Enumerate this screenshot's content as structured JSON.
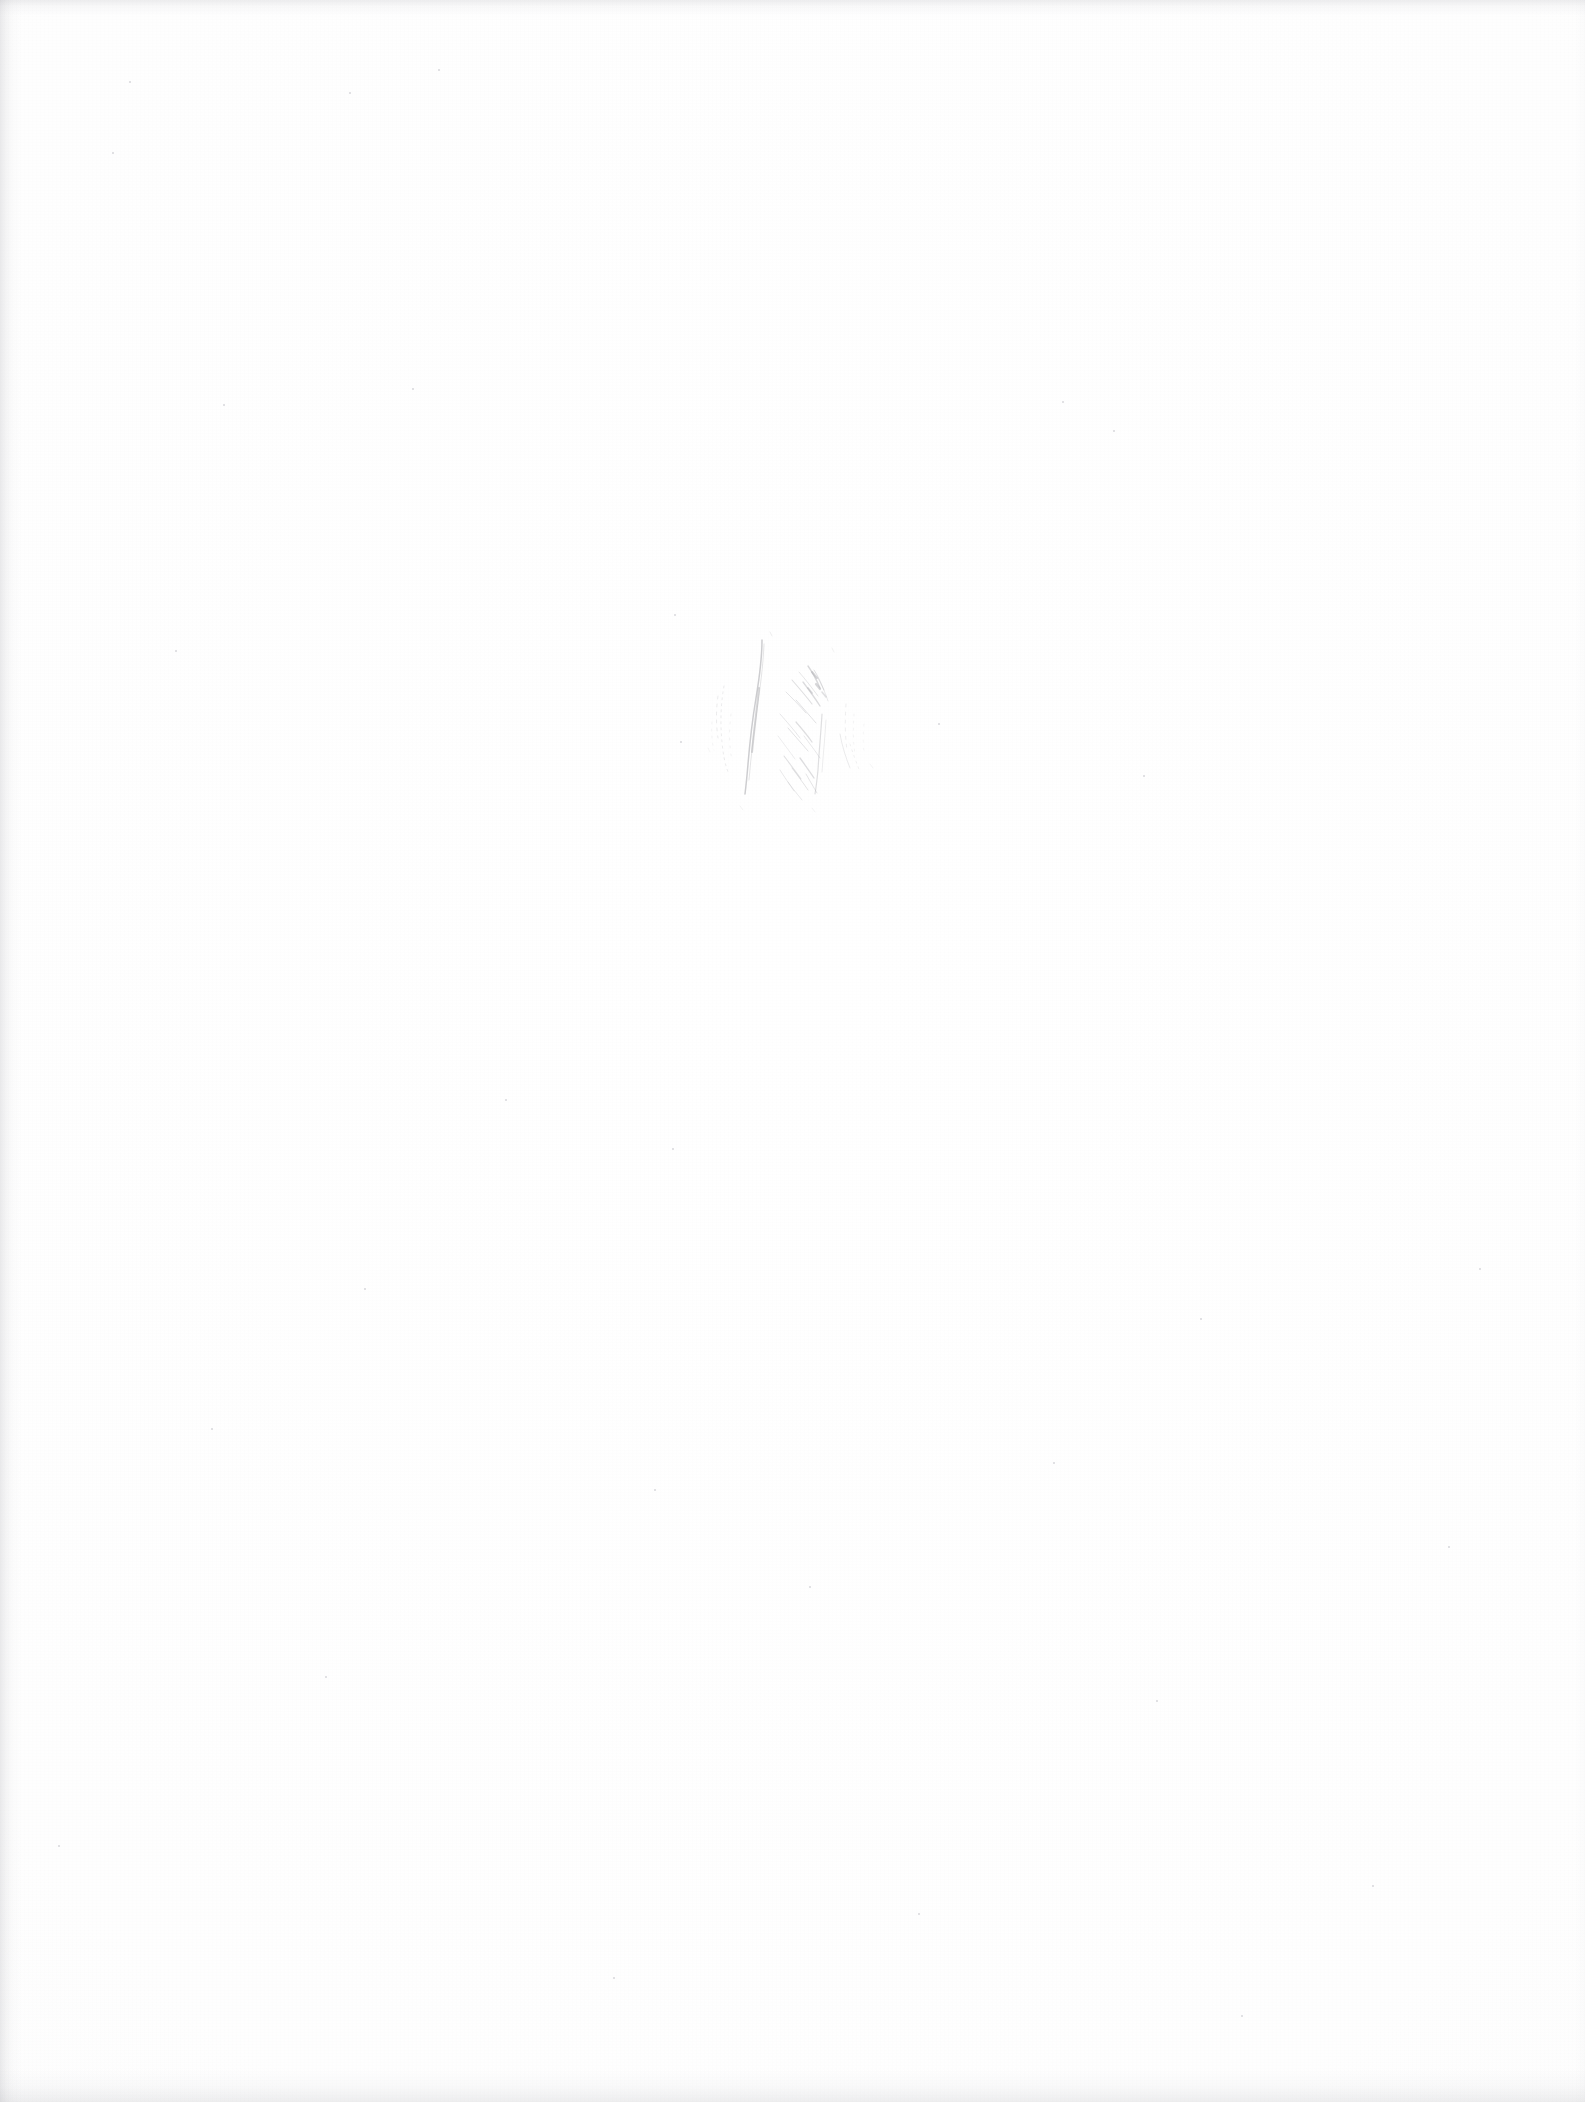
{
  "document": {
    "kind": "scanned-page",
    "page_title": "Blank scanned page",
    "background_color": "#fdfdfd",
    "width_px": 1585,
    "height_px": 2102,
    "text_content": "",
    "visible_text_lines": [],
    "notes_label": ""
  },
  "artifacts": {
    "pencil_mark": {
      "name": "pencil-smudge",
      "description": "Faint graphite pencil smudge of short near-vertical strokes",
      "ink_color": "#6e6e76",
      "bounds": {
        "x": 700,
        "y": 618,
        "width": 200,
        "height": 200
      },
      "opacity": 0.55
    },
    "edge_bands": [
      {
        "name": "left-edge-shadow",
        "side": "left",
        "thickness_px": 22,
        "color": "#96969e"
      },
      {
        "name": "top-edge-shadow",
        "side": "top",
        "thickness_px": 16,
        "color": "#96969e"
      },
      {
        "name": "bottom-edge-shadow",
        "side": "bottom",
        "thickness_px": 34,
        "color": "#96969e"
      },
      {
        "name": "right-edge-shadow",
        "side": "right",
        "thickness_px": 10,
        "color": "#bebec4"
      }
    ],
    "specks": [
      {
        "x": 129,
        "y": 81
      },
      {
        "x": 349,
        "y": 92
      },
      {
        "x": 438,
        "y": 69
      },
      {
        "x": 112,
        "y": 152
      },
      {
        "x": 1062,
        "y": 401
      },
      {
        "x": 223,
        "y": 404
      },
      {
        "x": 412,
        "y": 388
      },
      {
        "x": 1113,
        "y": 430
      },
      {
        "x": 674,
        "y": 614
      },
      {
        "x": 1143,
        "y": 775
      },
      {
        "x": 175,
        "y": 650
      },
      {
        "x": 680,
        "y": 741
      },
      {
        "x": 938,
        "y": 723
      },
      {
        "x": 505,
        "y": 1099
      },
      {
        "x": 672,
        "y": 1148
      },
      {
        "x": 1479,
        "y": 1268
      },
      {
        "x": 364,
        "y": 1288
      },
      {
        "x": 1200,
        "y": 1318
      },
      {
        "x": 211,
        "y": 1428
      },
      {
        "x": 654,
        "y": 1489
      },
      {
        "x": 1053,
        "y": 1462
      },
      {
        "x": 1448,
        "y": 1546
      },
      {
        "x": 809,
        "y": 1586
      },
      {
        "x": 325,
        "y": 1676
      },
      {
        "x": 1156,
        "y": 1700
      },
      {
        "x": 58,
        "y": 1845
      },
      {
        "x": 918,
        "y": 1913
      },
      {
        "x": 1372,
        "y": 1885
      },
      {
        "x": 613,
        "y": 1977
      },
      {
        "x": 1241,
        "y": 2015
      }
    ]
  }
}
